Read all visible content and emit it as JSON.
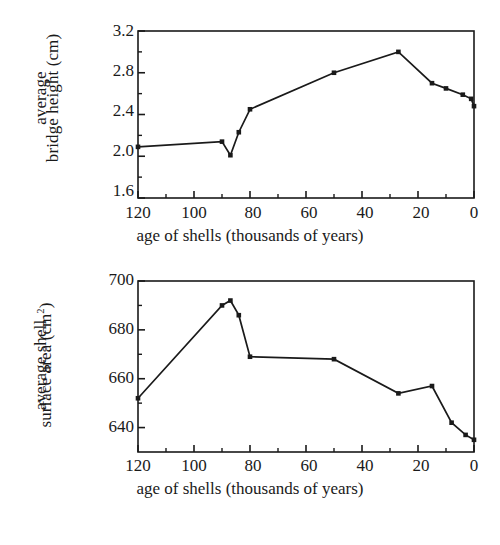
{
  "figure": {
    "background": "#ffffff",
    "ink": "#1a1a1a",
    "panels": [
      "bridge-height",
      "shell-surface-area"
    ]
  },
  "chart_data": [
    {
      "id": "bridge-height",
      "type": "line",
      "title": "",
      "xlabel": "age of shells (thousands of years)",
      "ylabel_line1": "average",
      "ylabel_line2": "bridge height (cm)",
      "ylabel_full": "average bridge height (cm)",
      "xlim": [
        120,
        0
      ],
      "ylim": [
        1.6,
        3.2
      ],
      "x_reversed": true,
      "grid": false,
      "legend": "none",
      "xticks": [
        120,
        100,
        80,
        60,
        40,
        20,
        0
      ],
      "xtick_labels": [
        "120",
        "100",
        "80",
        "60",
        "40",
        "20",
        "0"
      ],
      "x_minor_ticks": [
        110,
        90,
        70,
        50,
        30,
        10
      ],
      "yticks": [
        1.6,
        2.0,
        2.4,
        2.8,
        3.2
      ],
      "ytick_labels": [
        "1.6",
        "2.0",
        "2.4",
        "2.8",
        "3.2"
      ],
      "y_minor_ticks": [
        1.8,
        2.2,
        2.6,
        3.0
      ],
      "marker": "square",
      "x": [
        120,
        90,
        87,
        84,
        80,
        50,
        27,
        15,
        10,
        4,
        1,
        0
      ],
      "y": [
        2.09,
        2.14,
        2.01,
        2.23,
        2.45,
        2.8,
        3.0,
        2.7,
        2.65,
        2.59,
        2.55,
        2.48
      ],
      "units": "cm"
    },
    {
      "id": "shell-surface-area",
      "type": "line",
      "title": "",
      "xlabel": "age of shells (thousands of years)",
      "ylabel_line1": "average shell",
      "ylabel_line2": "surface area (cm²)",
      "ylabel_full": "average shell surface area (cm²)",
      "xlim": [
        120,
        0
      ],
      "ylim": [
        630,
        700
      ],
      "x_reversed": true,
      "grid": false,
      "legend": "none",
      "xticks": [
        120,
        100,
        80,
        60,
        40,
        20,
        0
      ],
      "xtick_labels": [
        "120",
        "100",
        "80",
        "60",
        "40",
        "20",
        "0"
      ],
      "x_minor_ticks": [
        110,
        90,
        70,
        50,
        30,
        10
      ],
      "yticks": [
        640,
        660,
        680,
        700
      ],
      "ytick_labels": [
        "640",
        "660",
        "680",
        "700"
      ],
      "y_minor_ticks": [
        650,
        670,
        690
      ],
      "marker": "square",
      "x": [
        120,
        90,
        87,
        84,
        80,
        50,
        27,
        15,
        8,
        3,
        0
      ],
      "y": [
        652,
        690,
        692,
        686,
        669,
        668,
        654,
        657,
        642,
        637,
        635
      ],
      "units": "cm2"
    }
  ]
}
